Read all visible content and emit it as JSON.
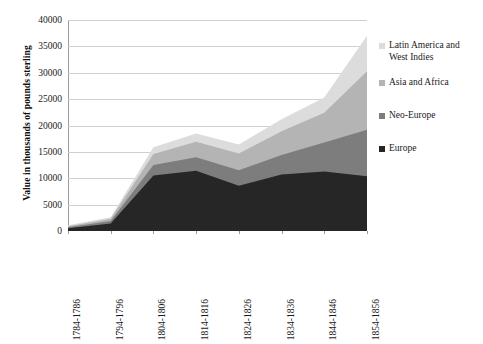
{
  "chart_data": {
    "type": "area",
    "stacked": true,
    "title": "",
    "xlabel": "",
    "ylabel": "Value in thousands of pounds sterling",
    "categories": [
      "1784-1786",
      "1794-1796",
      "1804-1806",
      "1814-1816",
      "1824-1826",
      "1834-1836",
      "1844-1846",
      "1854-1856"
    ],
    "ylim": [
      0,
      40000
    ],
    "ytick_labels": [
      "0",
      "5000",
      "10000",
      "15000",
      "20000",
      "25000",
      "30000",
      "35000",
      "40000"
    ],
    "ytick_values": [
      0,
      5000,
      10000,
      15000,
      20000,
      25000,
      30000,
      35000,
      40000
    ],
    "grid": true,
    "legend_position": "right",
    "series": [
      {
        "name": "Europe",
        "color": "#262626",
        "values": [
          500,
          1400,
          10500,
          11400,
          8600,
          10700,
          11300,
          10400
        ]
      },
      {
        "name": "Neo-Europe",
        "color": "#7d7d7d",
        "values": [
          200,
          500,
          2000,
          2600,
          2900,
          3700,
          5500,
          8800
        ]
      },
      {
        "name": "Asia and Africa",
        "color": "#b4b4b4",
        "values": [
          200,
          400,
          2100,
          2900,
          3200,
          4500,
          5600,
          11100
        ]
      },
      {
        "name": "Latin America and West Indies",
        "color": "#dcdcdc",
        "values": [
          200,
          300,
          1300,
          1600,
          1700,
          2300,
          2900,
          6700
        ]
      }
    ]
  },
  "legend": {
    "items": [
      {
        "label": "Latin America and\nWest Indies",
        "color": "#dcdcdc"
      },
      {
        "label": "Asia and Africa",
        "color": "#b4b4b4"
      },
      {
        "label": "Neo-Europe",
        "color": "#7d7d7d"
      },
      {
        "label": "Europe",
        "color": "#262626"
      }
    ]
  }
}
